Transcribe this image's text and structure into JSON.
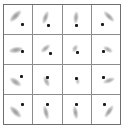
{
  "figure": {
    "title": "",
    "type": "psf-kernel-grid",
    "grid": {
      "rows": 4,
      "cols": 4
    },
    "colors": {
      "background": "#ffffff",
      "grid_line": "#8c8c8c",
      "border": "#6e6e6e",
      "blob": "#9b9b9b",
      "dot": "#1c1c1c"
    }
  },
  "chart_data": {
    "type": "heatmap",
    "title": "",
    "xlabel": "",
    "ylabel": "",
    "rows": 4,
    "cols": 4,
    "cells": [
      {
        "row": 1,
        "col": 1,
        "angle_deg": 45,
        "length": 15,
        "width": 6,
        "dot_at": "bottom-right",
        "dot_x": 66,
        "dot_y": 68,
        "blob_x": 40,
        "blob_y": 38,
        "intensity": 0.85
      },
      {
        "row": 1,
        "col": 2,
        "angle_deg": 70,
        "length": 13,
        "width": 5,
        "dot_at": "bottom",
        "dot_x": 53,
        "dot_y": 70,
        "blob_x": 45,
        "blob_y": 42,
        "intensity": 0.8
      },
      {
        "row": 1,
        "col": 3,
        "angle_deg": 85,
        "length": 12,
        "width": 5,
        "dot_at": "bottom",
        "dot_x": 50,
        "dot_y": 70,
        "blob_x": 47,
        "blob_y": 42,
        "intensity": 0.78
      },
      {
        "row": 1,
        "col": 4,
        "angle_deg": 135,
        "length": 14,
        "width": 5,
        "dot_at": "bottom-left",
        "dot_x": 38,
        "dot_y": 68,
        "blob_x": 62,
        "blob_y": 40,
        "intensity": 0.8
      },
      {
        "row": 2,
        "col": 1,
        "angle_deg": 10,
        "length": 14,
        "width": 6,
        "dot_at": "right",
        "dot_x": 66,
        "dot_y": 58,
        "blob_x": 42,
        "blob_y": 50,
        "intensity": 0.82
      },
      {
        "row": 2,
        "col": 2,
        "angle_deg": 40,
        "length": 11,
        "width": 5,
        "dot_at": "bottom-right",
        "dot_x": 60,
        "dot_y": 64,
        "blob_x": 44,
        "blob_y": 46,
        "intensity": 0.75
      },
      {
        "row": 2,
        "col": 3,
        "angle_deg": 60,
        "length": 8,
        "width": 5,
        "dot_at": "bottom",
        "dot_x": 52,
        "dot_y": 60,
        "blob_x": 46,
        "blob_y": 48,
        "intensity": 0.65
      },
      {
        "row": 2,
        "col": 4,
        "angle_deg": 150,
        "length": 10,
        "width": 5,
        "dot_at": "left",
        "dot_x": 42,
        "dot_y": 58,
        "blob_x": 58,
        "blob_y": 50,
        "intensity": 0.72
      },
      {
        "row": 3,
        "col": 1,
        "angle_deg": 145,
        "length": 13,
        "width": 6,
        "dot_at": "top-right",
        "dot_x": 62,
        "dot_y": 40,
        "blob_x": 40,
        "blob_y": 58,
        "intensity": 0.8
      },
      {
        "row": 3,
        "col": 2,
        "angle_deg": 115,
        "length": 11,
        "width": 5,
        "dot_at": "top",
        "dot_x": 52,
        "dot_y": 42,
        "blob_x": 46,
        "blob_y": 58,
        "intensity": 0.72
      },
      {
        "row": 3,
        "col": 3,
        "angle_deg": 100,
        "length": 7,
        "width": 4,
        "dot_at": "top",
        "dot_x": 50,
        "dot_y": 46,
        "blob_x": 52,
        "blob_y": 56,
        "intensity": 0.6
      },
      {
        "row": 3,
        "col": 4,
        "angle_deg": 20,
        "length": 12,
        "width": 5,
        "dot_at": "top-left",
        "dot_x": 40,
        "dot_y": 44,
        "blob_x": 60,
        "blob_y": 54,
        "intensity": 0.74
      },
      {
        "row": 4,
        "col": 1,
        "angle_deg": 135,
        "length": 15,
        "width": 6,
        "dot_at": "top-right",
        "dot_x": 64,
        "dot_y": 34,
        "blob_x": 40,
        "blob_y": 60,
        "intensity": 0.85
      },
      {
        "row": 4,
        "col": 2,
        "angle_deg": 105,
        "length": 14,
        "width": 5,
        "dot_at": "top",
        "dot_x": 52,
        "dot_y": 34,
        "blob_x": 46,
        "blob_y": 60,
        "intensity": 0.82
      },
      {
        "row": 4,
        "col": 3,
        "angle_deg": 100,
        "length": 13,
        "width": 5,
        "dot_at": "top",
        "dot_x": 50,
        "dot_y": 34,
        "blob_x": 46,
        "blob_y": 60,
        "intensity": 0.8
      },
      {
        "row": 4,
        "col": 4,
        "angle_deg": 55,
        "length": 14,
        "width": 5,
        "dot_at": "top-left",
        "dot_x": 44,
        "dot_y": 34,
        "blob_x": 62,
        "blob_y": 58,
        "intensity": 0.82
      }
    ]
  }
}
